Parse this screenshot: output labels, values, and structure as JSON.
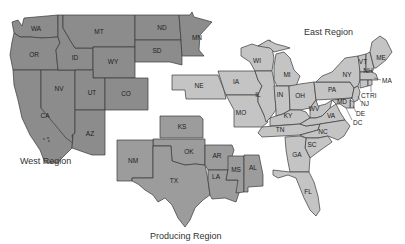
{
  "colors": {
    "west": "#8c8c8c",
    "producing": "#9c9c9c",
    "east": "#c4c4c4",
    "border": "#3a3a3a",
    "background": "#ffffff"
  },
  "regions": {
    "west": {
      "label": "West Region",
      "states": [
        "WA",
        "OR",
        "CA",
        "ID",
        "NV",
        "MT",
        "WY",
        "UT",
        "CO",
        "AZ",
        "ND",
        "SD",
        "MN"
      ]
    },
    "producing": {
      "label": "Producing Region",
      "states": [
        "KS",
        "OK",
        "NM",
        "TX",
        "AR",
        "LA",
        "MS",
        "AL"
      ]
    },
    "east": {
      "label": "East Region",
      "states": [
        "NE",
        "IA",
        "MO",
        "WI",
        "IL",
        "MI",
        "IN",
        "OH",
        "KY",
        "TN",
        "WV",
        "VA",
        "NC",
        "SC",
        "GA",
        "FL",
        "PA",
        "NY",
        "VT",
        "NH",
        "ME",
        "MA",
        "CT",
        "RI",
        "NJ",
        "DE",
        "MD",
        "DC"
      ]
    }
  },
  "labels": {
    "WA": "WA",
    "OR": "OR",
    "CA": "CA",
    "ID": "ID",
    "NV": "NV",
    "MT": "MT",
    "WY": "WY",
    "UT": "UT",
    "CO": "CO",
    "AZ": "AZ",
    "ND": "ND",
    "SD": "SD",
    "MN": "MN",
    "KS": "KS",
    "OK": "OK",
    "NM": "NM",
    "TX": "TX",
    "AR": "AR",
    "LA": "LA",
    "MS": "MS",
    "AL": "AL",
    "NE": "NE",
    "IA": "IA",
    "MO": "MO",
    "WI": "WI",
    "IL": "IL",
    "MI": "MI",
    "IN": "IN",
    "OH": "OH",
    "KY": "KY",
    "TN": "TN",
    "WV": "WV",
    "VA": "VA",
    "NC": "NC",
    "SC": "SC",
    "GA": "GA",
    "FL": "FL",
    "PA": "PA",
    "NY": "NY",
    "VT": "VT",
    "NH": "NH",
    "ME": "ME",
    "MA": "MA",
    "CT": "CT",
    "RI": "RI",
    "NJ": "NJ",
    "DE": "DE",
    "MD": "MD",
    "DC": "DC"
  }
}
